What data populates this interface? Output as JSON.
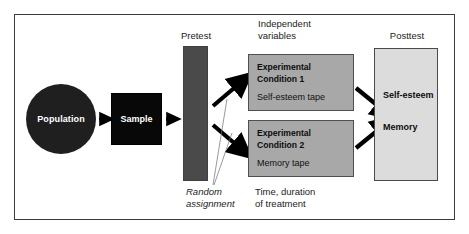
{
  "figure": {
    "type": "experimental-design-flow-diagram",
    "border_color": "#3b3b3b",
    "background": "#ffffff",
    "page_sliver_left": "",
    "page_sliver_right": ""
  },
  "nodes": {
    "population": {
      "label": "Population",
      "shape": "circle",
      "fill": "#1f1f1f",
      "text_color": "#ffffff"
    },
    "sample": {
      "label": "Sample",
      "shape": "rect",
      "fill": "#080808",
      "text_color": "#ffffff"
    },
    "pretest": {
      "header": "Pretest",
      "shape": "rect",
      "fill": "#4a4a4a"
    },
    "posttest": {
      "header": "Posttest",
      "fill": "#dcdcdc",
      "entries": [
        "Self-esteem",
        "Memory"
      ]
    }
  },
  "independent_variables": {
    "header": "Independent\nvariables",
    "fill": "#a8a8a8",
    "conditions": [
      {
        "title": "Experimental\nCondition 1",
        "treatment": "Self-esteem tape"
      },
      {
        "title": "Experimental\nCondition 2",
        "treatment": "Memory tape"
      }
    ]
  },
  "annotations": {
    "random_assignment": "Random\nassignment",
    "time_duration": "Time, duration\nof treatment"
  }
}
